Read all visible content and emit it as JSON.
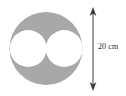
{
  "figure": {
    "background_color": "#ffffff",
    "outer_circle": {
      "name": "large shaded circle",
      "fill_color": "#a8a8a8",
      "center_x": 46,
      "center_y": 48.5,
      "radius": 36.5
    },
    "inner_circles": [
      {
        "name": "left white circle",
        "fill_color": "#ffffff",
        "center_x": 28.25,
        "center_y": 48.5,
        "radius": 18.25
      },
      {
        "name": "right white circle",
        "fill_color": "#ffffff",
        "center_x": 64.25,
        "center_y": 48.5,
        "radius": 18.25
      }
    ],
    "dimension": {
      "label": "20 cm",
      "value": "20",
      "unit": "cm",
      "orientation": "vertical",
      "line_color": "#3a3a3a",
      "x": 93,
      "y_top": 8,
      "y_bottom": 90,
      "arrowheads": "both"
    }
  },
  "chart_data": {
    "type": "diagram",
    "title": "",
    "shapes": [
      {
        "shape": "circle",
        "role": "outer",
        "fill": "#a8a8a8",
        "diameter_label": "20 cm"
      },
      {
        "shape": "circle",
        "role": "inner-left",
        "fill": "#ffffff"
      },
      {
        "shape": "circle",
        "role": "inner-right",
        "fill": "#ffffff"
      }
    ],
    "annotations": [
      {
        "text": "20 cm",
        "type": "dimension",
        "measures": "outer circle diameter",
        "position": "right"
      }
    ],
    "legend": [],
    "grid": false
  }
}
